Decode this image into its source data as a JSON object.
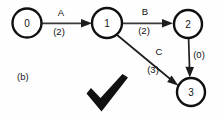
{
  "figure": {
    "panel_label": "(b)",
    "caption_mark": "check-mark"
  },
  "graph": {
    "nodes": [
      {
        "id": "n0",
        "label": "0",
        "cx": 27,
        "cy": 23,
        "r": 14.5
      },
      {
        "id": "n1",
        "label": "1",
        "cx": 107,
        "cy": 23,
        "r": 15.0
      },
      {
        "id": "n2",
        "label": "2",
        "cx": 188,
        "cy": 24,
        "r": 14.0
      },
      {
        "id": "n3",
        "label": "3",
        "cx": 191,
        "cy": 92,
        "r": 14.0
      }
    ],
    "edges": [
      {
        "id": "eA",
        "from": "0",
        "to": "1",
        "label": "A",
        "weight": "(2)",
        "label_x": 61,
        "label_y": 16,
        "weight_x": 59,
        "weight_y": 35
      },
      {
        "id": "eB",
        "from": "1",
        "to": "2",
        "label": "B",
        "weight": "(2)",
        "label_x": 145,
        "label_y": 15,
        "weight_x": 144,
        "weight_y": 34
      },
      {
        "id": "eC",
        "from": "1",
        "to": "3",
        "label": "C",
        "weight": "(3)",
        "label_x": 159,
        "label_y": 55,
        "weight_x": 153,
        "weight_y": 73
      },
      {
        "id": "eD",
        "from": "2",
        "to": "3",
        "label": "",
        "weight": "(0)",
        "label_x": 0,
        "label_y": 0,
        "weight_x": 197,
        "weight_y": 58
      }
    ]
  },
  "colors": {
    "node_stroke": "#101010",
    "node_fill": "#ffffff",
    "edge_stroke": "#3a3a3a",
    "text": "#101010",
    "checkmark": "#111111",
    "background": "#fefefe"
  }
}
